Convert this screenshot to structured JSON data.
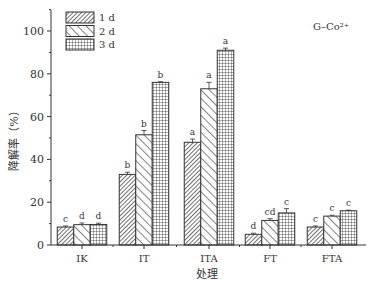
{
  "chart_data": {
    "type": "bar",
    "title": "",
    "annotation": "G–Co²⁺",
    "xlabel": "处理",
    "ylabel": "降解率（%）",
    "ylim": [
      0,
      110
    ],
    "yticks": [
      0,
      20,
      40,
      60,
      80,
      100
    ],
    "grid": false,
    "legend_position": "upper-left",
    "categories": [
      "IK",
      "IT",
      "ITA",
      "FT",
      "FTA"
    ],
    "series": [
      {
        "name": "1 d",
        "pattern": "diagonal-fine",
        "values": [
          8.4,
          33,
          48,
          5,
          8.4
        ],
        "errors": [
          0.5,
          1,
          1.5,
          0.5,
          0.5
        ],
        "letters": [
          "c",
          "b",
          "a",
          "d",
          "c"
        ]
      },
      {
        "name": "2 d",
        "pattern": "diagonal-wide",
        "values": [
          9.5,
          51.5,
          73,
          11.5,
          13.5
        ],
        "errors": [
          0.8,
          2,
          3,
          0.8,
          0.4
        ],
        "letters": [
          "d",
          "b",
          "a",
          "cd",
          "c"
        ]
      },
      {
        "name": "3 d",
        "pattern": "grid",
        "values": [
          9.6,
          76,
          91,
          15,
          16
        ],
        "errors": [
          0.6,
          0.3,
          1,
          2,
          0.3
        ],
        "letters": [
          "d",
          "b",
          "a",
          "c",
          "c"
        ]
      }
    ]
  }
}
